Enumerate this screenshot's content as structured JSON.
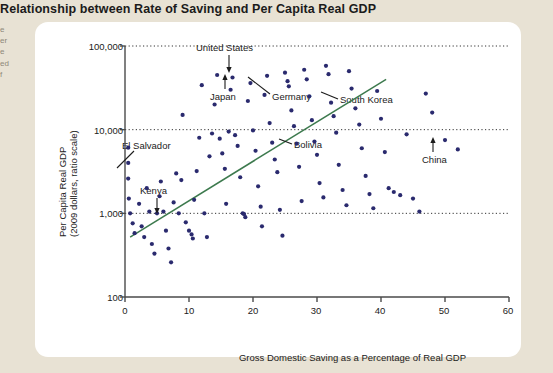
{
  "page": {
    "title": "Relationship between Rate of Saving and Per Capita Real GDP",
    "margin_note": "e\ner\ne\ned\nf",
    "background_color": "#e8e2d4",
    "card_color": "#ffffff"
  },
  "chart_data": {
    "type": "scatter",
    "title": "Relationship between Rate of Saving and Per Capita Real GDP",
    "xlabel": "Gross Domestic Saving as a Percentage of Real GDP",
    "ylabel": "Per Capita Real GDP\n(2009 dollars, ratio scale)",
    "ylabel_line1": "Per Capita Real GDP",
    "ylabel_line2": "(2009 dollars, ratio scale)",
    "yscale": "log",
    "xscale": "linear",
    "xlim": [
      0,
      60
    ],
    "ylim": [
      100,
      100000
    ],
    "xticks": [
      0,
      10,
      20,
      30,
      40,
      50,
      60
    ],
    "xticklabels": [
      "0",
      "10",
      "20",
      "30",
      "40",
      "50",
      "60"
    ],
    "yticks": [
      100,
      1000,
      10000,
      100000
    ],
    "yticklabels": [
      "100",
      "1,000",
      "10,000",
      "100,000"
    ],
    "grid": "horizontal-dotted",
    "legend": "none",
    "point_color": "#2a2a6e",
    "trendline_color": "#3d7a4e",
    "trendline": {
      "x_start": 0.8,
      "y_start": 520,
      "x_end": 40.8,
      "y_end": 40000
    },
    "points": [
      {
        "x": 0.5,
        "y": 6100
      },
      {
        "x": 0.5,
        "y": 4000
      },
      {
        "x": 0.5,
        "y": 2600
      },
      {
        "x": 0.6,
        "y": 1500
      },
      {
        "x": 0.8,
        "y": 1000
      },
      {
        "x": 1.2,
        "y": 760
      },
      {
        "x": 1.5,
        "y": 580
      },
      {
        "x": 2.2,
        "y": 1300
      },
      {
        "x": 2.6,
        "y": 700
      },
      {
        "x": 3.0,
        "y": 520
      },
      {
        "x": 3.4,
        "y": 2000
      },
      {
        "x": 3.8,
        "y": 1050
      },
      {
        "x": 4.2,
        "y": 430
      },
      {
        "x": 4.6,
        "y": 330
      },
      {
        "x": 5.0,
        "y": 1000
      },
      {
        "x": 5.4,
        "y": 1600
      },
      {
        "x": 5.6,
        "y": 2400
      },
      {
        "x": 6.0,
        "y": 1050
      },
      {
        "x": 6.4,
        "y": 620
      },
      {
        "x": 6.8,
        "y": 380
      },
      {
        "x": 7.2,
        "y": 260
      },
      {
        "x": 7.6,
        "y": 1350
      },
      {
        "x": 8.0,
        "y": 3000
      },
      {
        "x": 8.4,
        "y": 1000
      },
      {
        "x": 8.8,
        "y": 2500
      },
      {
        "x": 9.0,
        "y": 15000
      },
      {
        "x": 9.5,
        "y": 780
      },
      {
        "x": 10.0,
        "y": 620
      },
      {
        "x": 10.4,
        "y": 560
      },
      {
        "x": 10.6,
        "y": 500
      },
      {
        "x": 10.8,
        "y": 1450
      },
      {
        "x": 11.2,
        "y": 3200
      },
      {
        "x": 11.6,
        "y": 8000
      },
      {
        "x": 12.0,
        "y": 34000
      },
      {
        "x": 12.4,
        "y": 1000
      },
      {
        "x": 12.8,
        "y": 520
      },
      {
        "x": 13.2,
        "y": 4800
      },
      {
        "x": 13.6,
        "y": 9000
      },
      {
        "x": 14.0,
        "y": 20000
      },
      {
        "x": 14.4,
        "y": 45000
      },
      {
        "x": 14.8,
        "y": 7800
      },
      {
        "x": 15.2,
        "y": 5200
      },
      {
        "x": 15.6,
        "y": 3400
      },
      {
        "x": 15.8,
        "y": 1300
      },
      {
        "x": 16.2,
        "y": 9500
      },
      {
        "x": 16.5,
        "y": 30000
      },
      {
        "x": 16.8,
        "y": 42000
      },
      {
        "x": 17.2,
        "y": 8600
      },
      {
        "x": 17.6,
        "y": 6400
      },
      {
        "x": 18.0,
        "y": 2700
      },
      {
        "x": 18.4,
        "y": 1000
      },
      {
        "x": 18.6,
        "y": 980
      },
      {
        "x": 18.8,
        "y": 900
      },
      {
        "x": 19.2,
        "y": 22000
      },
      {
        "x": 19.6,
        "y": 36000
      },
      {
        "x": 20.0,
        "y": 9800
      },
      {
        "x": 20.4,
        "y": 5600
      },
      {
        "x": 20.8,
        "y": 2100
      },
      {
        "x": 21.2,
        "y": 1200
      },
      {
        "x": 21.4,
        "y": 700
      },
      {
        "x": 21.8,
        "y": 26000
      },
      {
        "x": 22.2,
        "y": 44000
      },
      {
        "x": 22.6,
        "y": 12000
      },
      {
        "x": 23.0,
        "y": 7000
      },
      {
        "x": 23.4,
        "y": 4400
      },
      {
        "x": 23.8,
        "y": 3100
      },
      {
        "x": 24.2,
        "y": 1100
      },
      {
        "x": 24.6,
        "y": 540
      },
      {
        "x": 25.0,
        "y": 48000
      },
      {
        "x": 25.4,
        "y": 38000
      },
      {
        "x": 25.6,
        "y": 33000
      },
      {
        "x": 26.0,
        "y": 17000
      },
      {
        "x": 26.4,
        "y": 11000
      },
      {
        "x": 26.8,
        "y": 6800
      },
      {
        "x": 27.2,
        "y": 3600
      },
      {
        "x": 27.6,
        "y": 1400
      },
      {
        "x": 28.0,
        "y": 52000
      },
      {
        "x": 28.4,
        "y": 40000
      },
      {
        "x": 28.8,
        "y": 25000
      },
      {
        "x": 29.2,
        "y": 13000
      },
      {
        "x": 29.6,
        "y": 7200
      },
      {
        "x": 30.0,
        "y": 5000
      },
      {
        "x": 30.4,
        "y": 2300
      },
      {
        "x": 31.0,
        "y": 1550
      },
      {
        "x": 31.4,
        "y": 58000
      },
      {
        "x": 31.8,
        "y": 46000
      },
      {
        "x": 32.2,
        "y": 21000
      },
      {
        "x": 32.6,
        "y": 14500
      },
      {
        "x": 33.0,
        "y": 9200
      },
      {
        "x": 33.4,
        "y": 3800
      },
      {
        "x": 34.0,
        "y": 1900
      },
      {
        "x": 34.6,
        "y": 1250
      },
      {
        "x": 35.0,
        "y": 50000
      },
      {
        "x": 35.4,
        "y": 31000
      },
      {
        "x": 36.0,
        "y": 18000
      },
      {
        "x": 36.6,
        "y": 11500
      },
      {
        "x": 37.0,
        "y": 6000
      },
      {
        "x": 37.6,
        "y": 2800
      },
      {
        "x": 38.2,
        "y": 1700
      },
      {
        "x": 38.8,
        "y": 1150
      },
      {
        "x": 39.4,
        "y": 29000
      },
      {
        "x": 40.0,
        "y": 13500
      },
      {
        "x": 40.6,
        "y": 5400
      },
      {
        "x": 41.2,
        "y": 2000
      },
      {
        "x": 42.0,
        "y": 1800
      },
      {
        "x": 43.0,
        "y": 1650
      },
      {
        "x": 44.0,
        "y": 8800
      },
      {
        "x": 45.0,
        "y": 1500
      },
      {
        "x": 46.0,
        "y": 1050
      },
      {
        "x": 47.0,
        "y": 27000
      },
      {
        "x": 48.0,
        "y": 16000
      },
      {
        "x": 50.0,
        "y": 7500
      },
      {
        "x": 52.0,
        "y": 5800
      }
    ],
    "annotations": [
      {
        "label": "United States",
        "pointer": "arrow-down"
      },
      {
        "label": "Japan",
        "pointer": "arrow-up"
      },
      {
        "label": "Germany",
        "pointer": "leader-line"
      },
      {
        "label": "South Korea",
        "pointer": "leader-line"
      },
      {
        "label": "El Salvador",
        "pointer": "leader-line"
      },
      {
        "label": "Kenya",
        "pointer": "arrow-down"
      },
      {
        "label": "Bolivia",
        "pointer": "leader-line"
      },
      {
        "label": "China",
        "pointer": "arrow-up"
      }
    ]
  }
}
